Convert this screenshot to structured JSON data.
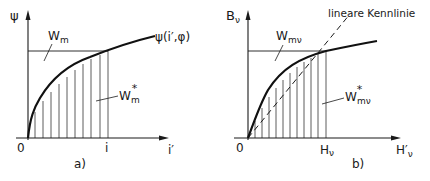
{
  "diagram_a": {
    "caption": "a)",
    "y_axis_label": "ψ",
    "x_axis_label": "i′",
    "origin_label": "0",
    "x_mark_label": "i",
    "curve_label": "ψ(i′,φ)",
    "upper_area_label": "W",
    "upper_area_sub": "m",
    "lower_area_label": "W",
    "lower_area_sub": "m",
    "lower_area_sup": "*"
  },
  "diagram_b": {
    "caption": "b)",
    "y_axis_label": "B",
    "y_axis_sub": "ν",
    "x_axis_label": "H′",
    "x_axis_sub": "ν",
    "origin_label": "0",
    "x_mark_label": "H",
    "x_mark_sub": "ν",
    "dashed_line_label": "lineare Kennlinie",
    "upper_area_label": "W",
    "upper_area_sub": "mν",
    "lower_area_label": "W",
    "lower_area_sub": "mν",
    "lower_area_sup": "*"
  },
  "colors": {
    "ink": "#1a1a1a",
    "background": "#ffffff"
  }
}
